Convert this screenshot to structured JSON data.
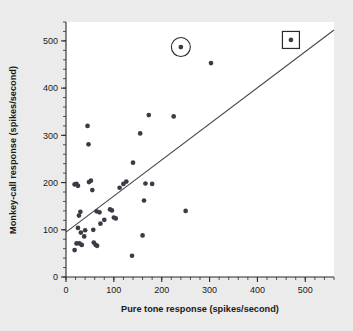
{
  "chart_data": {
    "type": "scatter",
    "title": "",
    "xlabel": "Pure tone response (spikes/second)",
    "ylabel": "Monkey-call response (spikes/second)",
    "xlim": [
      0,
      560
    ],
    "ylim": [
      0,
      540
    ],
    "xticks": [
      0,
      100,
      200,
      300,
      400,
      500
    ],
    "xtick_labels": [
      "0",
      "100",
      "200",
      "300",
      "400",
      "500"
    ],
    "yticks": [
      0,
      100,
      200,
      300,
      400,
      500
    ],
    "ytick_labels": [
      "0",
      "100",
      "200",
      "300",
      "400",
      "500"
    ],
    "xminor_step": 20,
    "yminor_step": 20,
    "grid": false,
    "legend": "none",
    "points": [
      [
        18,
        196
      ],
      [
        22,
        197
      ],
      [
        25,
        193
      ],
      [
        27,
        130
      ],
      [
        30,
        138
      ],
      [
        18,
        57
      ],
      [
        22,
        71
      ],
      [
        28,
        71
      ],
      [
        25,
        104
      ],
      [
        31,
        94
      ],
      [
        33,
        68
      ],
      [
        38,
        86
      ],
      [
        40,
        99
      ],
      [
        45,
        320
      ],
      [
        47,
        281
      ],
      [
        48,
        201
      ],
      [
        52,
        204
      ],
      [
        55,
        184
      ],
      [
        57,
        100
      ],
      [
        58,
        73
      ],
      [
        62,
        68
      ],
      [
        65,
        66
      ],
      [
        64,
        139
      ],
      [
        70,
        137
      ],
      [
        72,
        113
      ],
      [
        80,
        121
      ],
      [
        92,
        143
      ],
      [
        96,
        141
      ],
      [
        100,
        126
      ],
      [
        104,
        124
      ],
      [
        112,
        189
      ],
      [
        120,
        197
      ],
      [
        126,
        202
      ],
      [
        138,
        45
      ],
      [
        140,
        242
      ],
      [
        155,
        304
      ],
      [
        160,
        88
      ],
      [
        163,
        162
      ],
      [
        166,
        198
      ],
      [
        173,
        343
      ],
      [
        180,
        197
      ],
      [
        225,
        340
      ],
      [
        240,
        487
      ],
      [
        250,
        140
      ],
      [
        303,
        453
      ],
      [
        470,
        502
      ]
    ],
    "highlighted": [
      {
        "x": 240,
        "y": 487,
        "marker": "circle-ring",
        "label": "circled-outlier"
      },
      {
        "x": 470,
        "y": 502,
        "marker": "square-box",
        "label": "boxed-outlier"
      }
    ],
    "fit_line": {
      "x0": 0,
      "y0": 95,
      "x1": 560,
      "y1": 523,
      "slope": 0.765,
      "intercept": 95
    },
    "point_color": "#3b3b46",
    "line_color": "#43434c",
    "axis_color": "#2b2b2b",
    "background_color": "#ebebeb",
    "plot_area_color": "#ffffff"
  }
}
